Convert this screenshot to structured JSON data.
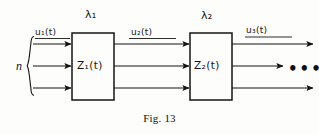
{
  "figure": {
    "caption": "Fig. 13",
    "background_color": "#fdfdfb",
    "ink_color": "#141414"
  },
  "diagram": {
    "type": "block-diagram",
    "input_group_label": "n",
    "blocks": [
      {
        "id": "block-1",
        "label": "Z",
        "label_subscript": "1",
        "label_arg": "(t)",
        "label_full": "Z₁(t)",
        "rate_symbol": "λ",
        "rate_subscript": "1",
        "rate_full": "λ₁",
        "x": 72,
        "y": 33,
        "width": 42,
        "height": 67
      },
      {
        "id": "block-2",
        "label": "Z",
        "label_subscript": "2",
        "label_arg": "(t)",
        "label_full": "Z₂(t)",
        "rate_symbol": "λ",
        "rate_subscript": "2",
        "rate_full": "λ₂",
        "x": 190,
        "y": 33,
        "width": 42,
        "height": 67
      }
    ],
    "signals": [
      {
        "id": "signal-u1",
        "symbol": "u",
        "subscript": "1",
        "arg": "(t)",
        "full": "u₁(t)",
        "stage": "input"
      },
      {
        "id": "signal-u2",
        "symbol": "u",
        "subscript": "2",
        "arg": "(t)",
        "full": "u₂(t)",
        "stage": "between-blocks"
      },
      {
        "id": "signal-u3",
        "symbol": "u",
        "subscript": "3",
        "arg": "(t)",
        "full": "u₃(t)",
        "stage": "output"
      }
    ],
    "line_rows_y": [
      44,
      66,
      88
    ],
    "continuation": "•••"
  }
}
